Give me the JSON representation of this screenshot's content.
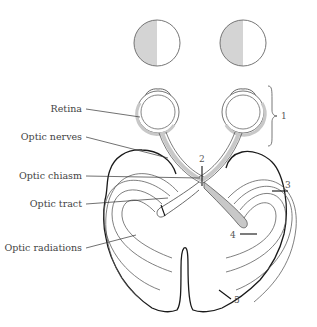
{
  "diagram": {
    "labels": {
      "retina": "Retina",
      "optic_nerves": "Optic nerves",
      "optic_chiasm": "Optic chiasm",
      "optic_tract": "Optic tract",
      "optic_radiations": "Optic radiations"
    },
    "numbers": {
      "n1": "1",
      "n2": "2",
      "n3": "3",
      "n4": "4",
      "n5": "5"
    },
    "visual_fields": [
      {
        "name": "left-eye-field",
        "shaded_half": "left"
      },
      {
        "name": "right-eye-field",
        "shaded_half": "left"
      }
    ],
    "colors": {
      "shade": "#d4d4d4",
      "outline": "#1a1a1a",
      "pathway_fill": "#c8c8c8",
      "text": "#444444"
    }
  }
}
